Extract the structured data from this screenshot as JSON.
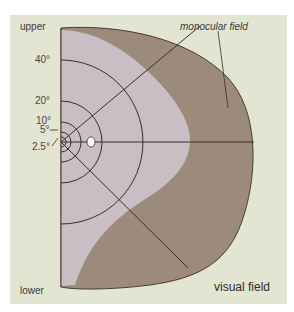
{
  "diagram": {
    "title": "visual field",
    "labels": {
      "upper": "upper",
      "lower": "lower",
      "monocular": "monocular field",
      "visual_field": "visual field"
    },
    "eccentricities": [
      {
        "label": "40°",
        "radius_px": 82
      },
      {
        "label": "20°",
        "radius_px": 41
      },
      {
        "label": "10°",
        "radius_px": 20
      },
      {
        "label": "5°",
        "radius_px": 10
      },
      {
        "label": "2.5°",
        "radius_px": 5
      }
    ],
    "regions": {
      "binocular_field_color": "#c8bec3",
      "monocular_field_color": "#9c8b7b",
      "background_color": "#e3e5d3",
      "line_color": "#3b2f2a"
    },
    "features": {
      "blind_spot": "white oval right of fixation"
    }
  }
}
